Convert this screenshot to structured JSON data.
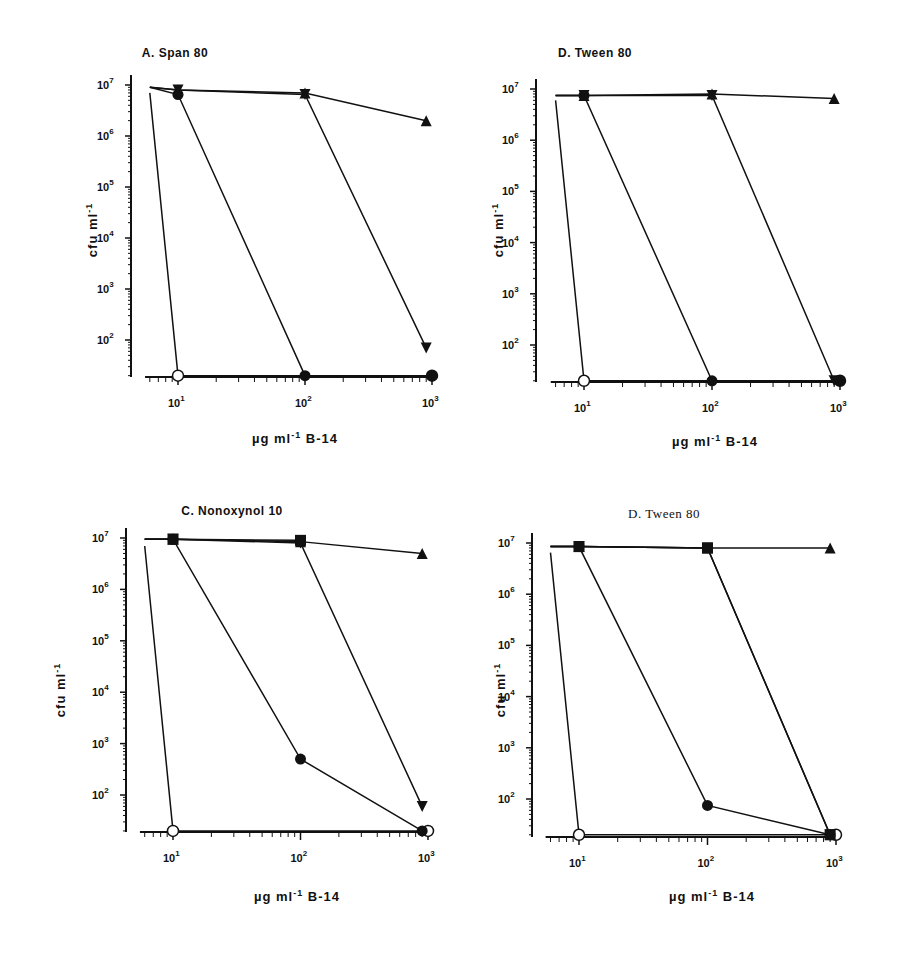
{
  "figure": {
    "panels": [
      {
        "id": "A",
        "title": "A. Span 80",
        "title_style": "sans",
        "ylabel": "cfu ml",
        "ylabel_sup": "-1",
        "xlabel_prefix": "µg ml",
        "xlabel_sup": "-1",
        "xlabel_suffix": " B-14"
      },
      {
        "id": "B",
        "title": "D. Tween 80",
        "title_style": "sans",
        "ylabel": "cfu ml",
        "ylabel_sup": "-1",
        "xlabel_prefix": "µg ml",
        "xlabel_sup": "-1",
        "xlabel_suffix": " B-14"
      },
      {
        "id": "C",
        "title": "C. Nonoxynol 10",
        "title_style": "sans",
        "ylabel": "cfu ml",
        "ylabel_sup": "-1",
        "xlabel_prefix": "µg ml",
        "xlabel_sup": "-1",
        "xlabel_suffix": " B-14"
      },
      {
        "id": "D",
        "title": "D. Tween 80",
        "title_style": "serif",
        "ylabel": "cfu ml",
        "ylabel_sup": "-1",
        "xlabel_prefix": "µg ml",
        "xlabel_sup": "-1",
        "xlabel_suffix": " B-14"
      }
    ]
  },
  "chart_data": [
    {
      "type": "line",
      "title": "A. Span 80",
      "xlabel": "µg ml^-1 B-14",
      "ylabel": "cfu ml^-1",
      "xscale": "log",
      "yscale": "log",
      "xlim": [
        5.5,
        1000
      ],
      "ylim": [
        20,
        10000000
      ],
      "xticks": [
        "10^1",
        "10^2",
        "10^3"
      ],
      "yticks": [
        "10^2",
        "10^3",
        "10^4",
        "10^5",
        "10^6",
        "10^7"
      ],
      "grid": false,
      "series": [
        {
          "name": "open circle",
          "marker": "circle-open",
          "x": [
            6,
            10,
            1000
          ],
          "y": [
            7000000,
            20,
            20
          ]
        },
        {
          "name": "filled circle",
          "marker": "circle-filled",
          "x": [
            6,
            10,
            100,
            1000
          ],
          "y": [
            9000000,
            6500000,
            20,
            20
          ]
        },
        {
          "name": "down triangle",
          "marker": "triangle-down",
          "x": [
            6,
            10,
            100,
            900
          ],
          "y": [
            9000000,
            8000000,
            6500000,
            70
          ]
        },
        {
          "name": "up triangle",
          "marker": "triangle-up",
          "x": [
            6,
            10,
            100,
            900
          ],
          "y": [
            9000000,
            8000000,
            7000000,
            2000000
          ]
        }
      ]
    },
    {
      "type": "line",
      "title": "D. Tween 80",
      "xlabel": "µg ml^-1 B-14",
      "ylabel": "cfu ml^-1",
      "xscale": "log",
      "yscale": "log",
      "xlim": [
        5.5,
        1000
      ],
      "ylim": [
        20,
        10000000
      ],
      "xticks": [
        "10^1",
        "10^2",
        "10^3"
      ],
      "yticks": [
        "10^2",
        "10^3",
        "10^4",
        "10^5",
        "10^6",
        "10^7"
      ],
      "grid": false,
      "series": [
        {
          "name": "open circle",
          "marker": "circle-open",
          "x": [
            6,
            10,
            1000
          ],
          "y": [
            6000000,
            20,
            20
          ]
        },
        {
          "name": "filled circle",
          "marker": "circle-filled",
          "x": [
            6,
            10,
            100,
            1000
          ],
          "y": [
            7500000,
            7500000,
            20,
            20
          ]
        },
        {
          "name": "down triangle",
          "marker": "triangle-down",
          "x": [
            6,
            10,
            100,
            900
          ],
          "y": [
            7500000,
            7500000,
            7500000,
            20
          ]
        },
        {
          "name": "up triangle",
          "marker": "triangle-up",
          "x": [
            6,
            10,
            100,
            900
          ],
          "y": [
            7500000,
            7500000,
            8000000,
            6500000
          ]
        }
      ]
    },
    {
      "type": "line",
      "title": "C. Nonoxynol 10",
      "xlabel": "µg ml^-1 B-14",
      "ylabel": "cfu ml^-1",
      "xscale": "log",
      "yscale": "log",
      "xlim": [
        5.5,
        1000
      ],
      "ylim": [
        20,
        10000000
      ],
      "xticks": [
        "10^1",
        "10^2",
        "10^3"
      ],
      "yticks": [
        "10^2",
        "10^3",
        "10^4",
        "10^5",
        "10^6",
        "10^7"
      ],
      "grid": false,
      "series": [
        {
          "name": "open circle",
          "marker": "circle-open",
          "x": [
            6,
            10,
            1000
          ],
          "y": [
            7000000,
            20,
            20
          ]
        },
        {
          "name": "filled circle",
          "marker": "circle-filled",
          "x": [
            6,
            10,
            100,
            900
          ],
          "y": [
            9500000,
            9500000,
            500,
            20
          ]
        },
        {
          "name": "filled square",
          "marker": "square-filled",
          "x": [
            6,
            10,
            100
          ],
          "y": [
            9500000,
            9500000,
            9000000
          ]
        },
        {
          "name": "down triangle",
          "marker": "triangle-down",
          "x": [
            6,
            10,
            100,
            900
          ],
          "y": [
            9500000,
            9500000,
            8000000,
            60
          ]
        },
        {
          "name": "up triangle",
          "marker": "triangle-up",
          "x": [
            6,
            10,
            100,
            900
          ],
          "y": [
            9500000,
            9500000,
            8500000,
            5000000
          ]
        }
      ]
    },
    {
      "type": "line",
      "title": "D. Tween 80",
      "xlabel": "µg ml^-1 B-14",
      "ylabel": "cfu ml^-1",
      "xscale": "log",
      "yscale": "log",
      "xlim": [
        5.5,
        1000
      ],
      "ylim": [
        20,
        10000000
      ],
      "xticks": [
        "10^1",
        "10^2",
        "10^3"
      ],
      "yticks": [
        "10^2",
        "10^3",
        "10^4",
        "10^5",
        "10^6",
        "10^7"
      ],
      "grid": false,
      "series": [
        {
          "name": "open circle",
          "marker": "circle-open",
          "x": [
            6,
            10,
            1000
          ],
          "y": [
            6500000,
            20,
            20
          ]
        },
        {
          "name": "filled circle",
          "marker": "circle-filled",
          "x": [
            6,
            10,
            100,
            900
          ],
          "y": [
            8500000,
            8500000,
            75,
            20
          ]
        },
        {
          "name": "filled square",
          "marker": "square-filled",
          "x": [
            6,
            10,
            100,
            900
          ],
          "y": [
            8500000,
            8500000,
            8000000,
            20
          ]
        },
        {
          "name": "down triangle",
          "marker": "triangle-down",
          "x": [
            6,
            10,
            100,
            900
          ],
          "y": [
            8500000,
            8500000,
            8000000,
            20
          ]
        },
        {
          "name": "up triangle",
          "marker": "triangle-up",
          "x": [
            6,
            10,
            100,
            900
          ],
          "y": [
            8500000,
            8500000,
            8000000,
            8000000
          ]
        }
      ]
    }
  ]
}
